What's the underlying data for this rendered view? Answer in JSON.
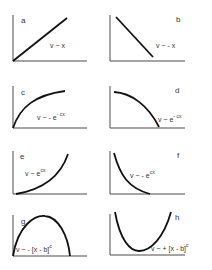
{
  "panels": [
    {
      "id": "a",
      "label": "a",
      "equation": "v ~ x",
      "equation_base": "v ~ x",
      "equation_sup": ""
    },
    {
      "id": "b",
      "label": "b",
      "equation": "v ~ - x",
      "equation_base": "v ~ - x",
      "equation_sup": ""
    },
    {
      "id": "c",
      "label": "c",
      "equation": "v ~ - e^(-cx)",
      "equation_base": "v ~ - e",
      "equation_sup": "- cx"
    },
    {
      "id": "d",
      "label": "d",
      "equation": "v ~ e^(-cx)",
      "equation_base": "v ~ e",
      "equation_sup": "- cx"
    },
    {
      "id": "e",
      "label": "e",
      "equation": "v ~ e^(cx)",
      "equation_base": "v ~ e",
      "equation_sup": "cx"
    },
    {
      "id": "f",
      "label": "f",
      "equation": "v ~ - e^(cx)",
      "equation_base": "v ~ - e",
      "equation_sup": "cx"
    },
    {
      "id": "g",
      "label": "g",
      "equation": "v ~ - [x - b]^c",
      "equation_base": "v ~ - [x - b]",
      "equation_sup": "c"
    },
    {
      "id": "h",
      "label": "h",
      "equation": "v ~ + [x - b]^c",
      "equation_base": "v ~ + [x - b]",
      "equation_sup": "c"
    }
  ],
  "colors": {
    "axis": "#4a4a4a",
    "curve": "#111111",
    "text": "#333333",
    "background": "#ffffff"
  }
}
